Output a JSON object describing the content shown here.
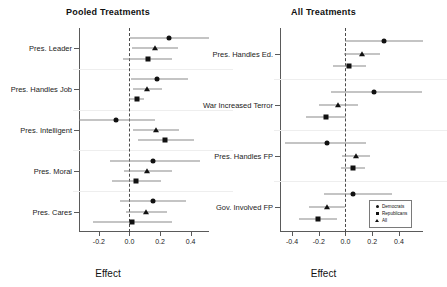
{
  "figure": {
    "width": 431,
    "height": 287,
    "background": "#ffffff",
    "marker_color": "#111111",
    "ci_color": "#8a8a8a",
    "zero_line_color": "#4a4a4a"
  },
  "legend": {
    "entries": [
      {
        "label": "Democrats",
        "marker": "circle"
      },
      {
        "label": "Republicans",
        "marker": "square"
      },
      {
        "label": "All",
        "marker": "triangle"
      }
    ]
  },
  "chart_data": [
    {
      "type": "scatter",
      "plot_style": "coefficient-plot",
      "panel": "left",
      "title": "Pooled Treatments",
      "xlabel": "Effect",
      "ylabel": "",
      "xlim": [
        -0.33,
        0.52
      ],
      "xticks": [
        -0.2,
        0.0,
        0.2,
        0.4
      ],
      "xticklabels": [
        "-0.2",
        "0.0",
        "0.2",
        "0.4"
      ],
      "grid": false,
      "zero_reference": 0.0,
      "legend_position": "none",
      "categories": [
        "Pres. Leader",
        "Pres. Handles Job",
        "Pres. Intelligent",
        "Pres. Moral",
        "Pres. Cares"
      ],
      "series": [
        {
          "name": "Democrats",
          "marker": "circle",
          "values": [
            0.26,
            0.18,
            -0.09,
            0.155,
            0.155
          ],
          "ci_low": [
            0.005,
            0.01,
            -0.33,
            -0.13,
            -0.06
          ],
          "ci_high": [
            0.52,
            0.385,
            0.17,
            0.46,
            0.37
          ]
        },
        {
          "name": "Republicans",
          "marker": "square",
          "values": [
            0.12,
            0.05,
            0.235,
            0.04,
            0.015
          ],
          "ci_low": [
            -0.04,
            0.0,
            0.055,
            -0.115,
            -0.24
          ],
          "ci_high": [
            0.275,
            0.095,
            0.42,
            0.205,
            0.28
          ]
        },
        {
          "name": "All",
          "marker": "triangle",
          "values": [
            0.17,
            0.115,
            0.175,
            0.115,
            0.105
          ],
          "ci_low": [
            0.015,
            0.02,
            0.025,
            -0.035,
            -0.025
          ],
          "ci_high": [
            0.32,
            0.215,
            0.325,
            0.275,
            0.245
          ]
        }
      ]
    },
    {
      "type": "scatter",
      "plot_style": "coefficient-plot",
      "panel": "right",
      "title": "All Treatments",
      "xlabel": "Effect",
      "ylabel": "",
      "xlim": [
        -0.49,
        0.58
      ],
      "xticks": [
        -0.4,
        -0.2,
        0.0,
        0.2,
        0.4
      ],
      "xticklabels": [
        "-0.4",
        "-0.2",
        "0.0",
        "0.2",
        "0.4"
      ],
      "grid": false,
      "zero_reference": 0.0,
      "legend_position": "bottom-right",
      "categories": [
        "Pres. Handles Ed.",
        "War Increased Terror",
        "Pres. Handles FP",
        "Gov. Involved FP"
      ],
      "series": [
        {
          "name": "Democrats",
          "marker": "circle",
          "values": [
            0.285,
            0.215,
            -0.135,
            0.055
          ],
          "ci_low": [
            0.0,
            -0.11,
            -0.45,
            -0.16
          ],
          "ci_high": [
            0.58,
            0.57,
            0.155,
            0.35
          ]
        },
        {
          "name": "Republicans",
          "marker": "square",
          "values": [
            0.03,
            -0.145,
            0.055,
            -0.205
          ],
          "ci_low": [
            -0.095,
            -0.295,
            -0.03,
            -0.345
          ],
          "ci_high": [
            0.15,
            0.005,
            0.145,
            -0.065
          ]
        },
        {
          "name": "All",
          "marker": "triangle",
          "values": [
            0.125,
            -0.055,
            0.075,
            -0.135
          ],
          "ci_low": [
            -0.01,
            -0.2,
            -0.025,
            -0.27
          ],
          "ci_high": [
            0.26,
            0.09,
            0.18,
            -0.005
          ]
        }
      ]
    }
  ]
}
